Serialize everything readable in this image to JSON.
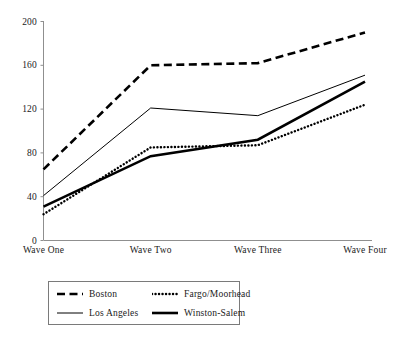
{
  "chart_data": {
    "type": "line",
    "title": "",
    "xlabel": "",
    "ylabel": "",
    "categories": [
      "Wave One",
      "Wave Two",
      "Wave Three",
      "Wave Four"
    ],
    "ylim": [
      0,
      200
    ],
    "yticks": [
      0,
      40,
      80,
      120,
      160,
      200
    ],
    "ytick_labels": [
      "0",
      "40",
      "80",
      "120",
      "160",
      "200"
    ],
    "grid": false,
    "legend_position": "below-left",
    "series": [
      {
        "name": "Boston",
        "style": "dashed",
        "color": "#000000",
        "width": 2.6,
        "values": [
          65,
          160,
          162,
          190
        ]
      },
      {
        "name": "Fargo/Moorhead",
        "style": "dotted",
        "color": "#000000",
        "width": 2.4,
        "values": [
          24,
          85,
          87,
          124
        ]
      },
      {
        "name": "Los Angeles",
        "style": "solid-thin",
        "color": "#000000",
        "width": 1.1,
        "values": [
          41,
          121,
          114,
          151
        ]
      },
      {
        "name": "Winston-Salem",
        "style": "solid-thick",
        "color": "#000000",
        "width": 2.6,
        "values": [
          31,
          77,
          92,
          145
        ]
      }
    ]
  },
  "axes": {
    "x_tick_labels": [
      "Wave One",
      "Wave Two",
      "Wave Three",
      "Wave Four"
    ],
    "y_tick_labels": [
      "200",
      "160",
      "120",
      "80",
      "40",
      "0"
    ]
  },
  "legend": {
    "entries": [
      {
        "label": "Boston",
        "style": "dashed"
      },
      {
        "label": "Fargo/Moorhead",
        "style": "dotted"
      },
      {
        "label": "Los Angeles",
        "style": "solid-thin"
      },
      {
        "label": "Winston-Salem",
        "style": "solid-thick"
      }
    ]
  },
  "colors": {
    "ink": "#000000",
    "axis": "#8a8a8a",
    "legend_border": "#7a7a7a",
    "background": "#ffffff"
  }
}
